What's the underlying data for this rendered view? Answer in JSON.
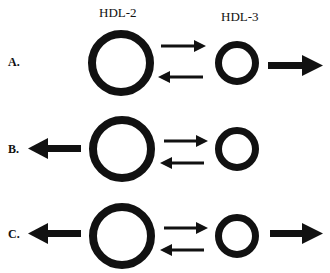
{
  "headers": {
    "hdl2": "HDL-2",
    "hdl3": "HDL-3"
  },
  "rows": [
    {
      "label": "A.",
      "left_efflux": false,
      "right_efflux": true
    },
    {
      "label": "B.",
      "left_efflux": true,
      "right_efflux": false
    },
    {
      "label": "C.",
      "left_efflux": true,
      "right_efflux": true
    }
  ],
  "colors": {
    "ink": "#111111",
    "background": "#ffffff"
  }
}
